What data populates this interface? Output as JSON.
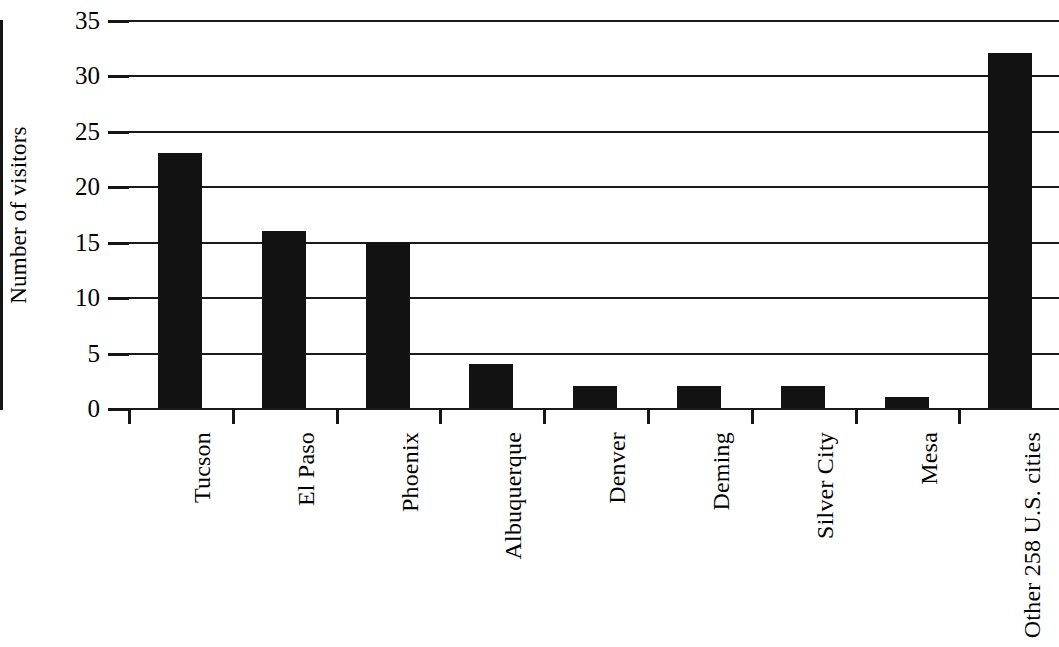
{
  "chart_data": {
    "type": "bar",
    "title": "",
    "xlabel": "",
    "ylabel": "Number of visitors",
    "ylim": [
      0,
      35
    ],
    "ytick_values": [
      35,
      30,
      25,
      20,
      15,
      10,
      5,
      0
    ],
    "ytick_labels": [
      "35",
      "30",
      "25",
      "20",
      "15",
      "10",
      "5",
      "0"
    ],
    "grid": true,
    "legend": false,
    "orientation": "vertical",
    "bar_color": "#121212",
    "categories": [
      "Tucson",
      "El Paso",
      "Phoenix",
      "Albuquerque",
      "Denver",
      "Deming",
      "Silver City",
      "Mesa",
      "Other 258 U.S. cities"
    ],
    "values": [
      23,
      16,
      15,
      4,
      2,
      2,
      2,
      1,
      32
    ]
  },
  "axes": {
    "y_title": "Number of visitors"
  }
}
